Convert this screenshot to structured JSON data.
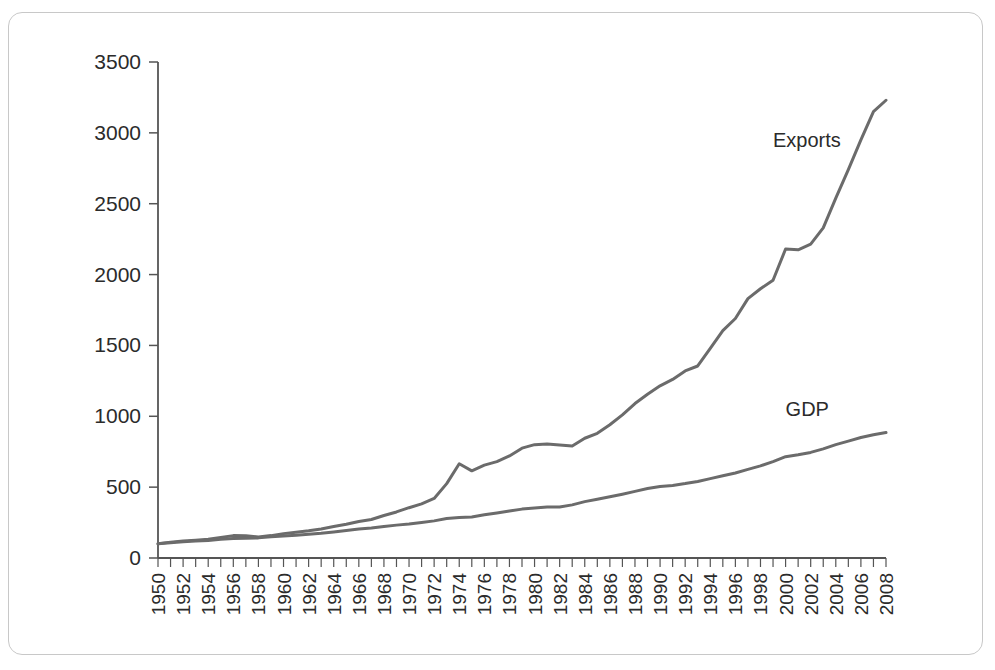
{
  "figure": {
    "border_color": "#c8c8c8",
    "background": "#ffffff"
  },
  "chart_data": {
    "type": "line",
    "title": "",
    "xlabel": "",
    "ylabel": "",
    "xlim": [
      1950,
      2008
    ],
    "ylim": [
      0,
      3500
    ],
    "grid": false,
    "legend_position": "inline-annotation",
    "line_color": "#6b6b6b",
    "axis_color": "#555555",
    "y_ticks": [
      0,
      500,
      1000,
      1500,
      2000,
      2500,
      3000,
      3500
    ],
    "y_tick_labels": [
      "0",
      "500",
      "1000",
      "1500",
      "2000",
      "2500",
      "3000",
      "3500"
    ],
    "x_ticks_minor_step": 1,
    "x_tick_labels": [
      "1950",
      "1952",
      "1954",
      "1956",
      "1958",
      "1960",
      "1962",
      "1964",
      "1966",
      "1968",
      "1970",
      "1972",
      "1974",
      "1976",
      "1978",
      "1980",
      "1982",
      "1984",
      "1986",
      "1988",
      "1990",
      "1992",
      "1994",
      "1996",
      "1998",
      "2000",
      "2002",
      "2004",
      "2006",
      "2008"
    ],
    "x": [
      1950,
      1951,
      1952,
      1953,
      1954,
      1955,
      1956,
      1957,
      1958,
      1959,
      1960,
      1961,
      1962,
      1963,
      1964,
      1965,
      1966,
      1967,
      1968,
      1969,
      1970,
      1971,
      1972,
      1973,
      1974,
      1975,
      1976,
      1977,
      1978,
      1979,
      1980,
      1981,
      1982,
      1983,
      1984,
      1985,
      1986,
      1987,
      1988,
      1989,
      1990,
      1991,
      1992,
      1993,
      1994,
      1995,
      1996,
      1997,
      1998,
      1999,
      2000,
      2001,
      2002,
      2003,
      2004,
      2005,
      2006,
      2007,
      2008
    ],
    "series": [
      {
        "name": "Exports",
        "label": "Exports",
        "label_x": 1999,
        "label_y": 2900,
        "color": "#6b6b6b",
        "values": [
          100,
          112,
          120,
          126,
          133,
          145,
          158,
          157,
          148,
          158,
          172,
          182,
          192,
          205,
          222,
          238,
          258,
          272,
          300,
          325,
          355,
          382,
          420,
          525,
          665,
          615,
          655,
          680,
          720,
          775,
          800,
          805,
          798,
          790,
          845,
          880,
          940,
          1010,
          1090,
          1155,
          1215,
          1260,
          1320,
          1355,
          1480,
          1605,
          1690,
          1830,
          1900,
          1960,
          2180,
          2175,
          2215,
          2330,
          2540,
          2740,
          2950,
          3150,
          3230
        ]
      },
      {
        "name": "GDP",
        "label": "GDP",
        "label_x": 2000,
        "label_y": 1000,
        "color": "#6b6b6b",
        "values": [
          100,
          108,
          114,
          120,
          124,
          132,
          137,
          140,
          142,
          150,
          155,
          160,
          168,
          175,
          184,
          194,
          205,
          212,
          222,
          232,
          240,
          250,
          262,
          278,
          285,
          290,
          305,
          318,
          332,
          345,
          352,
          360,
          360,
          375,
          398,
          415,
          432,
          450,
          470,
          490,
          505,
          512,
          525,
          540,
          560,
          580,
          600,
          625,
          650,
          680,
          715,
          728,
          745,
          770,
          800,
          825,
          850,
          870,
          885
        ]
      }
    ]
  }
}
